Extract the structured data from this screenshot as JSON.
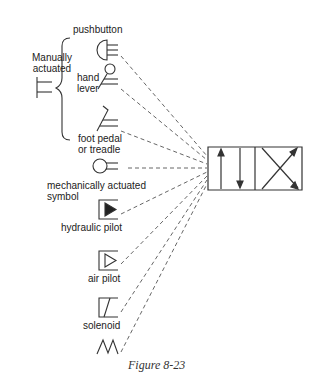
{
  "figure": {
    "caption": "Figure 8-23",
    "group_label_line1": "Manually",
    "group_label_line2": "actuated",
    "valve": "4-way directional control valve (two envelopes: parallel arrows, crossed arrows)"
  },
  "symbols": [
    {
      "id": "pushbutton",
      "label_lines": [
        "pushbutton"
      ],
      "icon": "pushbutton-icon"
    },
    {
      "id": "hand-lever",
      "label_lines": [
        "hand",
        "lever"
      ],
      "icon": "hand-lever-icon"
    },
    {
      "id": "foot-pedal",
      "label_lines": [
        "foot pedal",
        "or treadle"
      ],
      "icon": "foot-pedal-icon"
    },
    {
      "id": "mechanical",
      "label_lines": [
        "mechanically actuated",
        "symbol"
      ],
      "icon": "mechanical-actuator-icon"
    },
    {
      "id": "hydraulic-pilot",
      "label_lines": [
        "hydraulic pilot"
      ],
      "icon": "hydraulic-pilot-icon"
    },
    {
      "id": "air-pilot",
      "label_lines": [
        "air pilot"
      ],
      "icon": "air-pilot-icon"
    },
    {
      "id": "solenoid",
      "label_lines": [
        "solenoid"
      ],
      "icon": "solenoid-icon"
    },
    {
      "id": "spring",
      "label_lines": [],
      "icon": "spring-icon"
    }
  ],
  "colors": {
    "line": "#333333",
    "dash": "#555555"
  }
}
